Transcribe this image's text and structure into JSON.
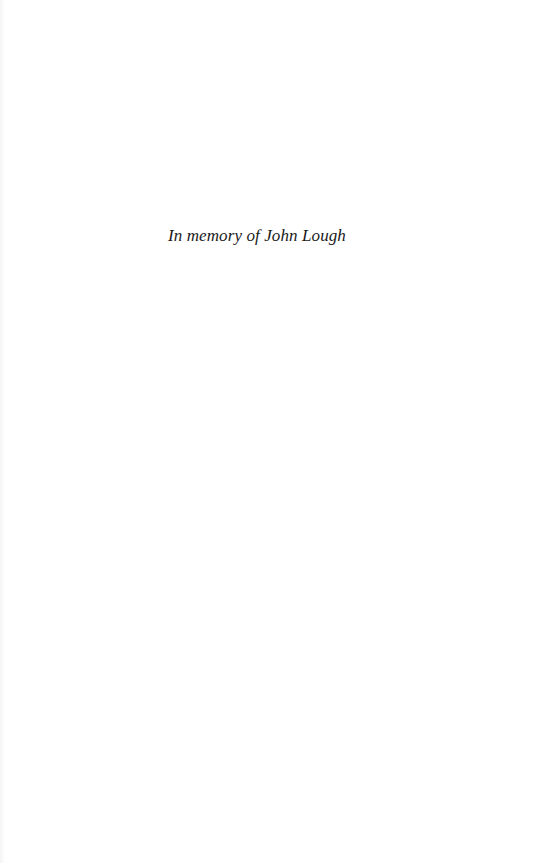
{
  "document": {
    "dedication": "In memory of John Lough"
  }
}
